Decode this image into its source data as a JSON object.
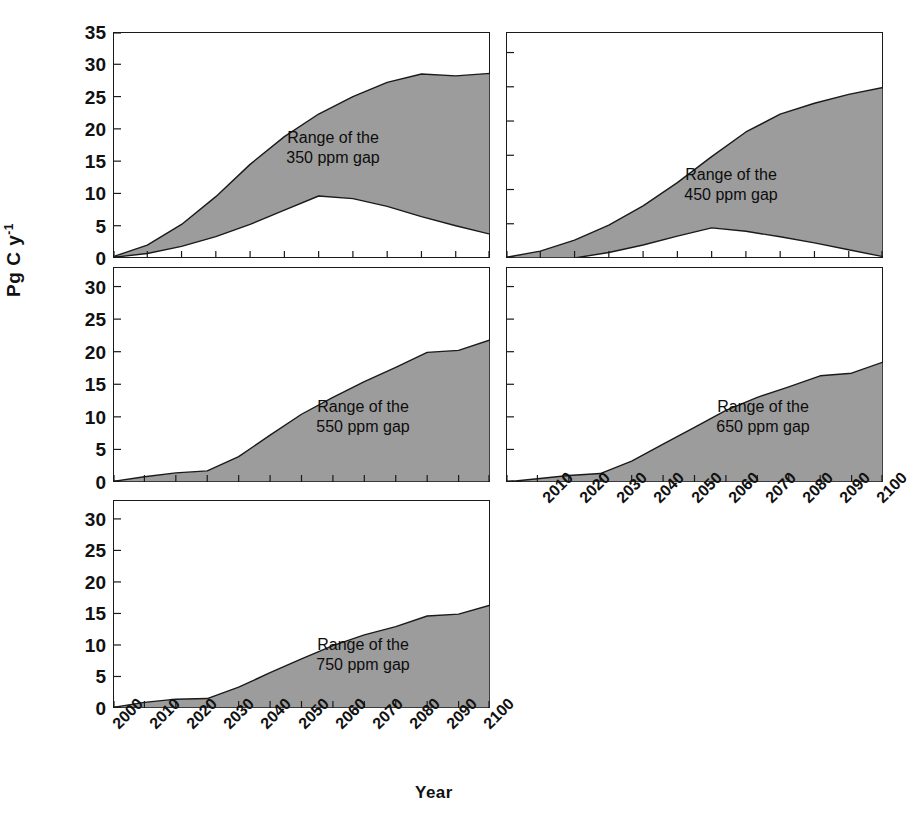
{
  "chart_data": {
    "type": "area",
    "title": "",
    "xlabel": "Year",
    "ylabel": "Pg C y-1",
    "ylabel_html": "Pg C y",
    "ylabel_exponent": "-1",
    "x": [
      2000,
      2010,
      2020,
      2030,
      2040,
      2050,
      2060,
      2070,
      2080,
      2090,
      2100
    ],
    "xlim": [
      2000,
      2105
    ],
    "grid": false,
    "legend": "none",
    "fill_color": "#9c9c9c",
    "line_color": "#1a1a1a",
    "panels": [
      {
        "id": "panel-350",
        "annotation_line1": "Range of the",
        "annotation_line2": "350 ppm gap",
        "ylim": [
          0,
          35
        ],
        "yticks": [
          0,
          5,
          10,
          15,
          20,
          25,
          30,
          35
        ],
        "xticklabels_visible": false,
        "series": [
          {
            "name": "upper",
            "values": [
              0.2,
              2.0,
              5.2,
              9.5,
              14.5,
              18.8,
              22.3,
              25.0,
              27.2,
              28.5,
              28.2,
              28.6
            ]
          },
          {
            "name": "lower",
            "values": [
              0.1,
              0.7,
              1.8,
              3.3,
              5.2,
              7.4,
              9.6,
              9.2,
              8.0,
              6.4,
              5.0,
              3.7
            ]
          }
        ],
        "upper_final": 28.6,
        "lower_final": 3.7
      },
      {
        "id": "panel-450",
        "annotation_line1": "Range of the",
        "annotation_line2": "450 ppm gap",
        "ylim": [
          0,
          33
        ],
        "yticks": [
          0,
          5,
          10,
          15,
          20,
          25,
          30
        ],
        "xticklabels_visible": false,
        "series": [
          {
            "name": "upper",
            "values": [
              0.1,
              1.0,
              2.6,
              4.8,
              7.6,
              11.0,
              14.8,
              18.4,
              21.0,
              22.6,
              23.9,
              24.9
            ]
          },
          {
            "name": "lower",
            "values": [
              0.0,
              0.0,
              0.0,
              0.8,
              1.9,
              3.2,
              4.4,
              3.9,
              3.1,
              2.2,
              1.2,
              0.2
            ]
          }
        ],
        "upper_final": 24.9,
        "lower_final": 0.2
      },
      {
        "id": "panel-550",
        "annotation_line1": "Range of the",
        "annotation_line2": "550 ppm gap",
        "ylim": [
          0,
          33
        ],
        "yticks": [
          0,
          5,
          10,
          15,
          20,
          25,
          30
        ],
        "xticklabels_visible": false,
        "series": [
          {
            "name": "upper",
            "values": [
              0.1,
              0.8,
              1.4,
              1.7,
              3.9,
              7.2,
              10.4,
              13.0,
              15.4,
              17.6,
              19.9,
              20.2,
              21.8
            ]
          },
          {
            "name": "lower",
            "values": [
              0.0,
              0.0,
              0.0,
              0.0,
              0.0,
              0.0,
              0.0,
              0.0,
              0.0,
              0.0,
              0.0,
              0.0,
              0.0
            ]
          }
        ],
        "upper_final": 21.8,
        "lower_final": 0.0
      },
      {
        "id": "panel-650",
        "annotation_line1": "Range of the",
        "annotation_line2": "650 ppm gap",
        "ylim": [
          0,
          33
        ],
        "yticks": [
          0,
          5,
          10,
          15,
          20,
          25,
          30
        ],
        "xticklabels_visible": true,
        "series": [
          {
            "name": "upper",
            "values": [
              0.0,
              0.5,
              1.0,
              1.3,
              3.2,
              5.8,
              8.4,
              11.0,
              13.0,
              14.6,
              16.3,
              16.7,
              18.4
            ]
          },
          {
            "name": "lower",
            "values": [
              0.0,
              0.0,
              0.0,
              0.0,
              0.0,
              0.0,
              0.0,
              0.0,
              0.0,
              0.0,
              0.0,
              0.0,
              0.0
            ]
          }
        ],
        "upper_final": 18.4,
        "lower_final": 0.0
      },
      {
        "id": "panel-750",
        "annotation_line1": "Range of the",
        "annotation_line2": "750 ppm gap",
        "ylim": [
          0,
          33
        ],
        "yticks": [
          0,
          5,
          10,
          15,
          20,
          25,
          30
        ],
        "xticklabels_visible": true,
        "series": [
          {
            "name": "upper",
            "values": [
              0.1,
              0.9,
              1.4,
              1.5,
              3.3,
              5.6,
              7.8,
              9.9,
              11.6,
              12.9,
              14.6,
              14.9,
              16.3
            ]
          },
          {
            "name": "lower",
            "values": [
              0.0,
              0.0,
              0.0,
              0.0,
              0.0,
              0.0,
              0.0,
              0.0,
              0.0,
              0.0,
              0.0,
              0.0,
              0.0
            ]
          }
        ],
        "upper_final": 16.3,
        "lower_final": 0.0
      }
    ],
    "xticklabels_left": [
      "2000",
      "2010",
      "2020",
      "2030",
      "2040",
      "2050",
      "2060",
      "2070",
      "2080",
      "2090",
      "2100"
    ],
    "xticklabels_right": [
      "2010",
      "2020",
      "2030",
      "2040",
      "2050",
      "2060",
      "2070",
      "2080",
      "2090",
      "2100"
    ]
  }
}
